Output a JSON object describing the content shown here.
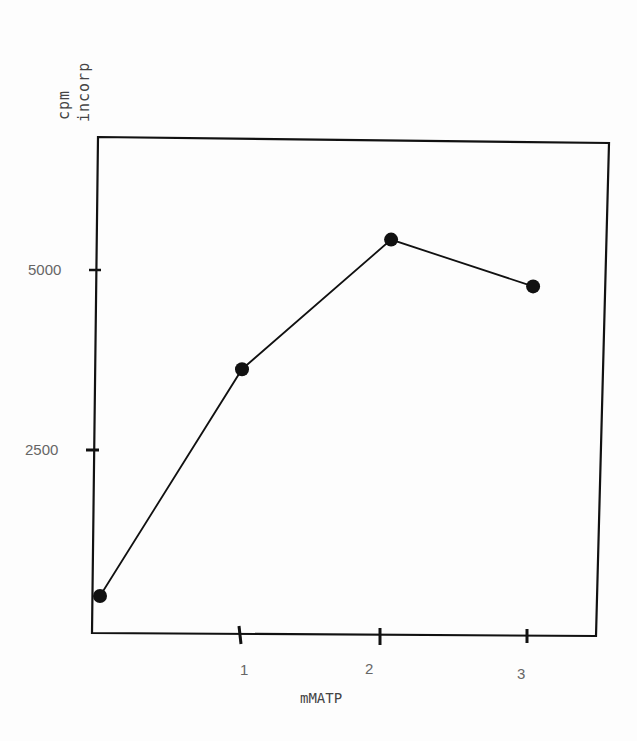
{
  "chart_data": {
    "type": "line",
    "title": "",
    "xlabel": "mMATP",
    "ylabel": "cpm incorp",
    "ylabel_lines": [
      "cpm",
      "incorp"
    ],
    "x_ticks": [
      "1",
      "2",
      "3"
    ],
    "y_ticks": [
      "2500",
      "5000"
    ],
    "xlim": [
      0,
      3.5
    ],
    "ylim": [
      0,
      6500
    ],
    "grid": false,
    "legend": null,
    "series": [
      {
        "name": "cpm incorp",
        "x": [
          0,
          1,
          2.05,
          3.05
        ],
        "y": [
          500,
          3650,
          5450,
          4800
        ],
        "marker": "filled-circle",
        "color": "#111111"
      }
    ]
  },
  "colors": {
    "ink": "#111111",
    "text": "#555555",
    "background": "#fdfdfd"
  }
}
